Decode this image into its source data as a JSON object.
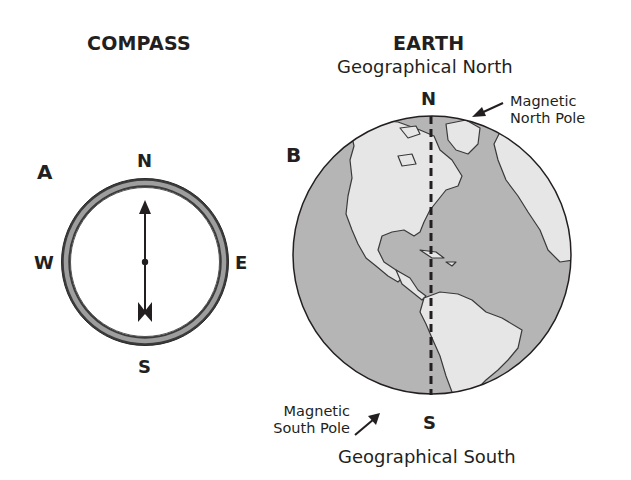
{
  "compass": {
    "title": "COMPASS",
    "panel_label": "A",
    "directions": {
      "north": "N",
      "south": "S",
      "east": "E",
      "west": "W"
    },
    "needle_points_to": "N"
  },
  "earth": {
    "title": "EARTH",
    "panel_label": "B",
    "geographical_north_label": "Geographical North",
    "geographical_south_label": "Geographical South",
    "north_marker": "N",
    "south_marker": "S",
    "magnetic_north_label": [
      "Magnetic",
      "North Pole"
    ],
    "magnetic_south_label": [
      "Magnetic",
      "South Pole"
    ]
  },
  "colors": {
    "ink": "#231f20",
    "ocean": "#b5b5b5",
    "land": "#e6e6e6",
    "ring": "#8c8c8c"
  }
}
